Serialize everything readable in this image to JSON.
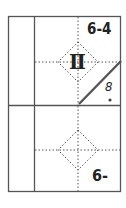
{
  "diagram": {
    "top_cell": {
      "label": "6-4",
      "symbol": "Ⅱ",
      "side_mark": "8"
    },
    "bottom_cell": {
      "label": "6-"
    },
    "colors": {
      "line": "#444444",
      "dotted": "#666666",
      "diagonal": "#555555"
    }
  }
}
